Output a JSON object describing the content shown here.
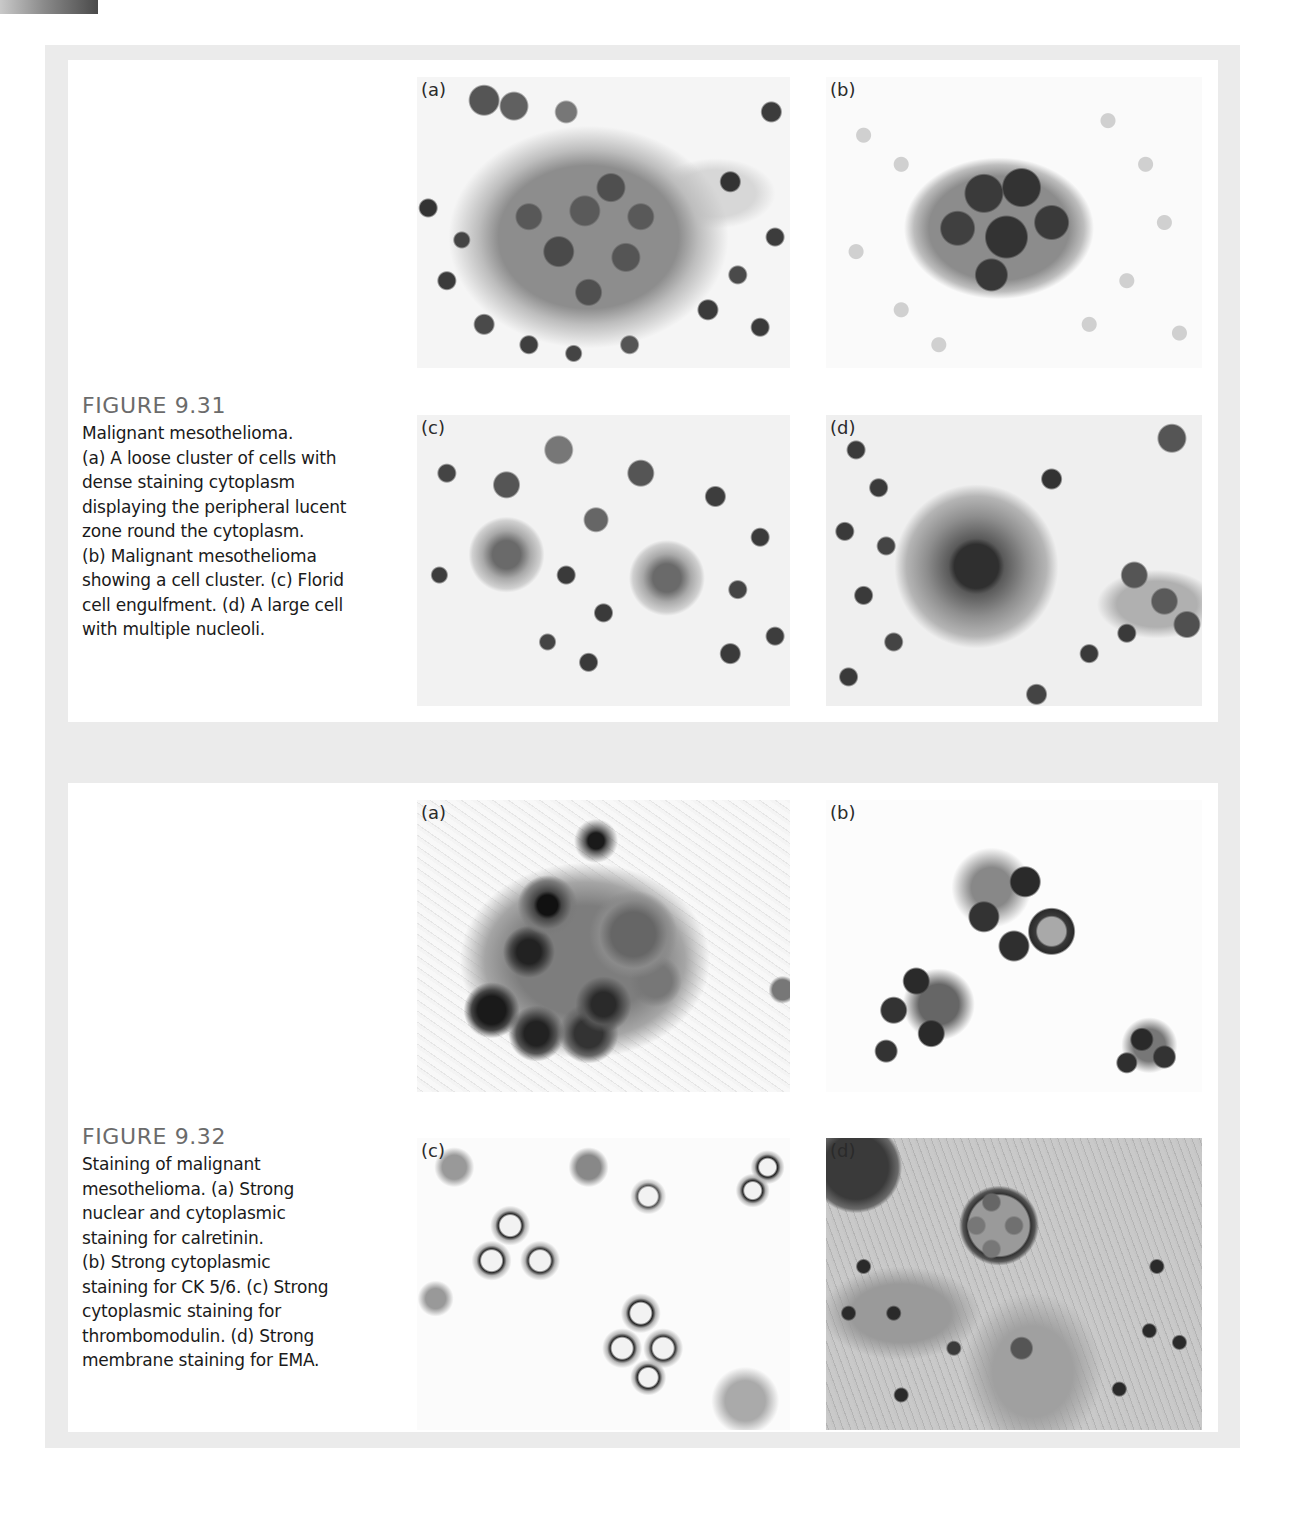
{
  "page": {
    "background": "#ffffff",
    "frame_color": "#ebebeb",
    "panel_color": "#ffffff",
    "title_color": "#6b6b6b"
  },
  "figures": [
    {
      "title": "FIGURE 9.31",
      "caption_lines": [
        "Malignant mesothelioma.",
        "(a) A loose cluster of cells with",
        "dense staining cytoplasm",
        "displaying the peripheral lucent",
        "zone round the cytoplasm.",
        "(b) Malignant mesothelioma",
        "showing a cell cluster. (c) Florid",
        "cell engulfment. (d) A large cell",
        "with multiple nucleoli."
      ],
      "panels": [
        {
          "label": "(a)",
          "description": "Loose cluster of cells with dense staining cytoplasm"
        },
        {
          "label": "(b)",
          "description": "Malignant mesothelioma cell cluster"
        },
        {
          "label": "(c)",
          "description": "Florid cell engulfment"
        },
        {
          "label": "(d)",
          "description": "Large cell with multiple nucleoli"
        }
      ]
    },
    {
      "title": "FIGURE 9.32",
      "caption_lines": [
        "Staining of malignant",
        "mesothelioma. (a) Strong",
        "nuclear and cytoplasmic",
        "staining for calretinin.",
        "(b) Strong cytoplasmic",
        "staining for CK 5/6. (c) Strong",
        "cytoplasmic staining for",
        "thrombomodulin. (d) Strong",
        "membrane staining for EMA."
      ],
      "panels": [
        {
          "label": "(a)",
          "description": "Calretinin nuclear and cytoplasmic staining"
        },
        {
          "label": "(b)",
          "description": "CK 5/6 cytoplasmic staining"
        },
        {
          "label": "(c)",
          "description": "Thrombomodulin cytoplasmic staining"
        },
        {
          "label": "(d)",
          "description": "EMA membrane staining"
        }
      ]
    }
  ]
}
